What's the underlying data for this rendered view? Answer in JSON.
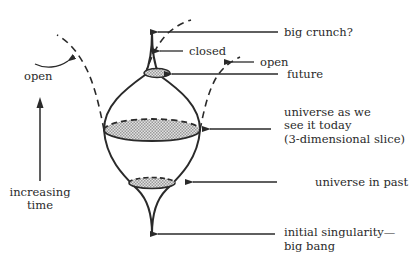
{
  "diagram": {
    "labels": {
      "big_crunch": "big crunch?",
      "closed": "closed",
      "open_right": "open",
      "future": "future",
      "today_line1": "universe as we",
      "today_line2": "see it today",
      "today_line3": "(3-dimensional slice)",
      "past": "universe in past",
      "singularity_line1": "initial singularity—",
      "singularity_line2": "big bang",
      "open_left": "open",
      "time_line1": "increasing",
      "time_line2": "time"
    },
    "colors": {
      "ink": "#2a2a2a",
      "slice_fill": "#c8c8c8",
      "background": "#ffffff"
    }
  }
}
